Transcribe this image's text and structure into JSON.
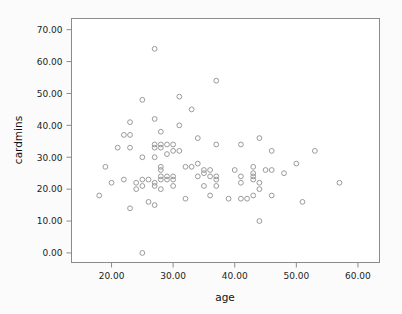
{
  "chart_data": {
    "type": "scatter",
    "title": "",
    "xlabel": "age",
    "ylabel": "cardmins",
    "xlim": [
      13.5,
      63.5
    ],
    "ylim": [
      -3.0,
      73.5
    ],
    "grid": false,
    "legend": null,
    "xticks": [
      20,
      30,
      40,
      50,
      60
    ],
    "xtick_labels": [
      "20.00",
      "30.00",
      "40.00",
      "50.00",
      "60.00"
    ],
    "yticks": [
      0,
      10,
      20,
      30,
      40,
      50,
      60,
      70
    ],
    "ytick_labels": [
      "0.00",
      "10.00",
      "20.00",
      "30.00",
      "40.00",
      "50.00",
      "60.00",
      "70.00"
    ],
    "marker": "open-circle",
    "marker_color": "#9a9a9a",
    "points": [
      [
        18,
        18
      ],
      [
        19,
        27
      ],
      [
        20,
        22
      ],
      [
        21,
        33
      ],
      [
        22,
        37
      ],
      [
        22,
        23
      ],
      [
        23,
        41
      ],
      [
        23,
        37
      ],
      [
        23,
        33
      ],
      [
        23,
        14
      ],
      [
        24,
        22
      ],
      [
        24,
        20
      ],
      [
        25,
        48
      ],
      [
        25,
        30
      ],
      [
        25,
        23
      ],
      [
        25,
        21
      ],
      [
        25,
        0
      ],
      [
        26,
        23
      ],
      [
        26,
        16
      ],
      [
        27,
        64
      ],
      [
        27,
        42
      ],
      [
        27,
        34
      ],
      [
        27,
        33
      ],
      [
        27,
        30
      ],
      [
        27,
        22
      ],
      [
        27,
        21
      ],
      [
        27,
        15
      ],
      [
        28,
        38
      ],
      [
        28,
        34
      ],
      [
        28,
        33
      ],
      [
        28,
        27
      ],
      [
        28,
        26
      ],
      [
        28,
        24
      ],
      [
        28,
        23
      ],
      [
        28,
        20
      ],
      [
        29,
        34
      ],
      [
        29,
        31
      ],
      [
        29,
        24
      ],
      [
        29,
        23
      ],
      [
        30,
        34
      ],
      [
        30,
        32
      ],
      [
        30,
        24
      ],
      [
        30,
        23
      ],
      [
        30,
        21
      ],
      [
        31,
        49
      ],
      [
        31,
        40
      ],
      [
        31,
        32
      ],
      [
        32,
        27
      ],
      [
        32,
        17
      ],
      [
        33,
        45
      ],
      [
        33,
        27
      ],
      [
        34,
        36
      ],
      [
        34,
        28
      ],
      [
        34,
        24
      ],
      [
        35,
        26
      ],
      [
        35,
        25
      ],
      [
        35,
        21
      ],
      [
        36,
        26
      ],
      [
        36,
        24
      ],
      [
        36,
        18
      ],
      [
        37,
        54
      ],
      [
        37,
        34
      ],
      [
        37,
        24
      ],
      [
        37,
        23
      ],
      [
        37,
        21
      ],
      [
        39,
        17
      ],
      [
        40,
        26
      ],
      [
        41,
        34
      ],
      [
        41,
        24
      ],
      [
        41,
        22
      ],
      [
        41,
        17
      ],
      [
        42,
        17
      ],
      [
        43,
        27
      ],
      [
        43,
        25
      ],
      [
        43,
        24
      ],
      [
        43,
        23
      ],
      [
        43,
        18
      ],
      [
        44,
        36
      ],
      [
        44,
        22
      ],
      [
        44,
        20
      ],
      [
        44,
        10
      ],
      [
        45,
        26
      ],
      [
        46,
        32
      ],
      [
        46,
        26
      ],
      [
        46,
        18
      ],
      [
        48,
        25
      ],
      [
        50,
        28
      ],
      [
        51,
        16
      ],
      [
        53,
        32
      ],
      [
        57,
        22
      ]
    ]
  },
  "axes": {
    "x_axis_name": "age-axis",
    "y_axis_name": "cardmins-axis"
  }
}
